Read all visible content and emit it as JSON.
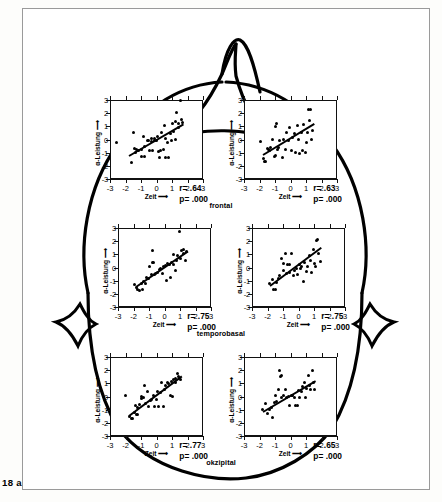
{
  "figure": {
    "caption": "18 a",
    "region_labels": [
      {
        "text": "frontal",
        "x": 221,
        "y": 201
      },
      {
        "text": "temporobasal",
        "x": 221,
        "y": 329
      },
      {
        "text": "okzipital",
        "x": 221,
        "y": 458
      }
    ],
    "head_outline_name": "head-outline-top-view"
  },
  "axes": {
    "xlabel": "Zeit ⟶",
    "ylabel": "α-Leistung ⟶",
    "xticks": [
      "-3",
      "-2",
      "-1",
      "0",
      "1",
      "2",
      "3"
    ],
    "yticks": [
      "3",
      "2",
      "1",
      "0",
      "-1",
      "-2",
      "-3"
    ],
    "xlim": [
      -3,
      3
    ],
    "ylim": [
      -3,
      3
    ]
  },
  "chart_data": [
    {
      "type": "scatter",
      "name": "frontal-left",
      "title": "frontal (left hemisphere)",
      "xlabel": "Zeit ⟶",
      "ylabel": "α-Leistung ⟶",
      "xlim": [
        -3,
        3
      ],
      "ylim": [
        -3,
        3
      ],
      "grid": false,
      "annotations": {
        "r": "r= .64",
        "p": "p= .000"
      },
      "r": 0.64,
      "p": 0.0,
      "fit_line": {
        "x0": -1.75,
        "y0": -1.15,
        "x1": 1.75,
        "y1": 1.25
      },
      "points": [
        [
          -2.55,
          -0.2
        ],
        [
          -1.6,
          -1.75
        ],
        [
          -1.5,
          0.5
        ],
        [
          -1.45,
          -0.7
        ],
        [
          -1.35,
          -0.95
        ],
        [
          -1.3,
          -0.75
        ],
        [
          -1.15,
          -0.8
        ],
        [
          -1.0,
          -1.3
        ],
        [
          -0.95,
          -0.75
        ],
        [
          -0.85,
          0.25
        ],
        [
          -0.8,
          -1.3
        ],
        [
          -0.75,
          -0.5
        ],
        [
          -0.6,
          -0.1
        ],
        [
          -0.5,
          -0.05
        ],
        [
          -0.45,
          -0.85
        ],
        [
          -0.35,
          0.1
        ],
        [
          -0.3,
          -0.15
        ],
        [
          -0.25,
          -0.85
        ],
        [
          -0.15,
          -0.05
        ],
        [
          -0.1,
          0.05
        ],
        [
          0.0,
          -0.1
        ],
        [
          0.05,
          0.2
        ],
        [
          0.1,
          -0.9
        ],
        [
          0.2,
          -1.35
        ],
        [
          0.25,
          -0.8
        ],
        [
          0.35,
          0.55
        ],
        [
          0.45,
          -0.75
        ],
        [
          0.5,
          1.05
        ],
        [
          0.55,
          -1.4
        ],
        [
          0.6,
          0.05
        ],
        [
          0.7,
          -0.25
        ],
        [
          0.8,
          -1.35
        ],
        [
          0.9,
          0.45
        ],
        [
          0.95,
          -0.1
        ],
        [
          1.05,
          1.2
        ],
        [
          1.1,
          0.6
        ],
        [
          1.2,
          1.35
        ],
        [
          1.25,
          0.0
        ],
        [
          1.3,
          2.05
        ],
        [
          1.4,
          0.9
        ],
        [
          1.45,
          1.25
        ],
        [
          1.55,
          2.95
        ],
        [
          1.6,
          1.55
        ],
        [
          1.7,
          1.3
        ]
      ]
    },
    {
      "type": "scatter",
      "name": "frontal-right",
      "title": "frontal (right hemisphere)",
      "xlabel": "Zeit ⟶",
      "ylabel": "α-Leistung ⟶",
      "xlim": [
        -3,
        3
      ],
      "ylim": [
        -3,
        3
      ],
      "grid": false,
      "annotations": {
        "r": "r= .63",
        "p": "p= .000"
      },
      "r": 0.63,
      "p": 0.0,
      "fit_line": {
        "x0": -1.8,
        "y0": -1.1,
        "x1": 1.5,
        "y1": 1.25
      },
      "points": [
        [
          -1.95,
          -0.15
        ],
        [
          -1.75,
          -1.45
        ],
        [
          -1.7,
          -1.7
        ],
        [
          -1.6,
          -1.65
        ],
        [
          -1.5,
          -0.7
        ],
        [
          -1.45,
          -0.75
        ],
        [
          -1.35,
          -0.85
        ],
        [
          -1.3,
          -0.6
        ],
        [
          -1.15,
          0.0
        ],
        [
          -1.05,
          -1.3
        ],
        [
          -1.0,
          -1.25
        ],
        [
          -0.95,
          1.0
        ],
        [
          -0.9,
          1.2
        ],
        [
          -0.85,
          -0.75
        ],
        [
          -0.8,
          -0.6
        ],
        [
          -0.7,
          -0.1
        ],
        [
          -0.5,
          -1.35
        ],
        [
          -0.45,
          0.0
        ],
        [
          -0.35,
          -0.75
        ],
        [
          -0.25,
          0.5
        ],
        [
          -0.15,
          -0.1
        ],
        [
          -0.05,
          0.9
        ],
        [
          0.05,
          -0.85
        ],
        [
          0.15,
          0.15
        ],
        [
          0.25,
          0.45
        ],
        [
          0.35,
          -0.95
        ],
        [
          0.45,
          1.05
        ],
        [
          0.5,
          0.0
        ],
        [
          0.6,
          -1.1
        ],
        [
          0.7,
          0.55
        ],
        [
          0.8,
          -0.8
        ],
        [
          0.85,
          1.15
        ],
        [
          0.95,
          -0.95
        ],
        [
          1.0,
          -0.25
        ],
        [
          1.1,
          0.5
        ],
        [
          1.15,
          2.25
        ],
        [
          1.2,
          1.45
        ],
        [
          1.3,
          2.3
        ],
        [
          1.35,
          0.0
        ],
        [
          1.45,
          0.65
        ]
      ]
    },
    {
      "type": "scatter",
      "name": "temporobasal-left",
      "title": "temporobasal (left hemisphere)",
      "xlabel": "Zeit ⟶",
      "ylabel": "α-Leistung ⟶",
      "xlim": [
        -3,
        3
      ],
      "ylim": [
        -3,
        3
      ],
      "grid": false,
      "annotations": {
        "r": "r= .75",
        "p": "p= .000"
      },
      "r": 0.75,
      "p": 0.0,
      "fit_line": {
        "x0": -1.85,
        "y0": -1.4,
        "x1": 1.5,
        "y1": 1.3
      },
      "points": [
        [
          -1.95,
          -1.3
        ],
        [
          -1.8,
          -1.5
        ],
        [
          -1.75,
          -1.7
        ],
        [
          -1.6,
          -1.75
        ],
        [
          -1.5,
          -1.25
        ],
        [
          -1.45,
          -1.7
        ],
        [
          -1.35,
          -1.1
        ],
        [
          -1.25,
          -1.2
        ],
        [
          -1.15,
          -0.75
        ],
        [
          -1.05,
          -0.8
        ],
        [
          -0.95,
          0.05
        ],
        [
          -0.85,
          -0.55
        ],
        [
          -0.8,
          0.35
        ],
        [
          -0.75,
          1.3
        ],
        [
          -0.7,
          0.35
        ],
        [
          -0.65,
          -0.5
        ],
        [
          -0.55,
          -0.45
        ],
        [
          -0.45,
          -0.35
        ],
        [
          -0.35,
          -0.15
        ],
        [
          -0.25,
          -0.05
        ],
        [
          -0.15,
          -0.45
        ],
        [
          -0.05,
          0.05
        ],
        [
          0.05,
          0.15
        ],
        [
          0.15,
          -0.95
        ],
        [
          0.2,
          0.3
        ],
        [
          0.3,
          0.25
        ],
        [
          0.4,
          -0.75
        ],
        [
          0.45,
          0.4
        ],
        [
          0.55,
          0.2
        ],
        [
          0.6,
          0.95
        ],
        [
          0.7,
          -0.2
        ],
        [
          0.8,
          0.55
        ],
        [
          0.85,
          0.9
        ],
        [
          0.95,
          2.75
        ],
        [
          1.0,
          0.65
        ],
        [
          1.1,
          1.3
        ],
        [
          1.2,
          1.1
        ],
        [
          1.25,
          1.35
        ],
        [
          1.35,
          0.5
        ],
        [
          1.45,
          1.25
        ]
      ]
    },
    {
      "type": "scatter",
      "name": "temporobasal-right",
      "title": "temporobasal (right hemisphere)",
      "xlabel": "Zeit ⟶",
      "ylabel": "α-Leistung ⟶",
      "xlim": [
        -3,
        3
      ],
      "ylim": [
        -3,
        3
      ],
      "grid": false,
      "annotations": {
        "r": "r= .75",
        "p": "p= .000"
      },
      "r": 0.75,
      "p": 0.0,
      "fit_line": {
        "x0": -1.85,
        "y0": -1.35,
        "x1": 1.45,
        "y1": 1.55
      },
      "points": [
        [
          -1.85,
          -1.25
        ],
        [
          -1.7,
          -0.9
        ],
        [
          -1.6,
          -1.7
        ],
        [
          -1.5,
          -1.7
        ],
        [
          -1.4,
          -1.15
        ],
        [
          -1.3,
          -0.85
        ],
        [
          -1.2,
          -0.6
        ],
        [
          -1.1,
          0.65
        ],
        [
          -1.0,
          -0.25
        ],
        [
          -0.95,
          0.3
        ],
        [
          -0.85,
          1.05
        ],
        [
          -0.8,
          -0.45
        ],
        [
          -0.7,
          0.2
        ],
        [
          -0.6,
          0.25
        ],
        [
          -0.55,
          -0.35
        ],
        [
          -0.45,
          1.1
        ],
        [
          -0.35,
          -0.6
        ],
        [
          -0.25,
          -0.25
        ],
        [
          -0.15,
          -0.05
        ],
        [
          -0.05,
          -0.5
        ],
        [
          0.05,
          0.2
        ],
        [
          0.15,
          -0.1
        ],
        [
          0.2,
          0.05
        ],
        [
          0.3,
          -1.05
        ],
        [
          0.4,
          0.35
        ],
        [
          0.5,
          -0.3
        ],
        [
          0.6,
          0.05
        ],
        [
          0.7,
          0.9
        ],
        [
          0.8,
          0.55
        ],
        [
          0.85,
          -0.4
        ],
        [
          0.95,
          1.35
        ],
        [
          1.0,
          0.3
        ],
        [
          1.1,
          0.1
        ],
        [
          1.15,
          2.05
        ],
        [
          1.25,
          2.15
        ],
        [
          1.3,
          1.1
        ],
        [
          1.4,
          0.45
        ]
      ]
    },
    {
      "type": "scatter",
      "name": "okzipital-left",
      "title": "okzipital (left hemisphere)",
      "xlabel": "Zeit ⟶",
      "ylabel": "α-Leistung ⟶",
      "xlim": [
        -3,
        3
      ],
      "ylim": [
        -3,
        3
      ],
      "grid": false,
      "annotations": {
        "r": "r= .77",
        "p": "p= .000"
      },
      "r": 0.77,
      "p": 0.0,
      "fit_line": {
        "x0": -1.8,
        "y0": -1.4,
        "x1": 1.6,
        "y1": 1.6
      },
      "points": [
        [
          -1.75,
          -1.55
        ],
        [
          -1.6,
          -1.7
        ],
        [
          -1.55,
          -1.7
        ],
        [
          -1.45,
          -1.25
        ],
        [
          -1.35,
          -0.7
        ],
        [
          -1.3,
          -1.4
        ],
        [
          -1.25,
          -1.4
        ],
        [
          -1.2,
          -0.85
        ],
        [
          -1.1,
          -0.6
        ],
        [
          -1.0,
          0.0
        ],
        [
          -0.95,
          -0.15
        ],
        [
          -0.85,
          -0.1
        ],
        [
          -0.75,
          0.85
        ],
        [
          -0.7,
          -0.55
        ],
        [
          -0.6,
          0.35
        ],
        [
          -0.5,
          -0.75
        ],
        [
          -0.4,
          -0.3
        ],
        [
          -0.3,
          -0.25
        ],
        [
          -0.2,
          0.05
        ],
        [
          -0.1,
          -0.75
        ],
        [
          0.0,
          -0.2
        ],
        [
          0.05,
          0.35
        ],
        [
          0.15,
          -0.75
        ],
        [
          0.25,
          0.3
        ],
        [
          0.35,
          1.05
        ],
        [
          0.45,
          -0.75
        ],
        [
          0.5,
          0.55
        ],
        [
          0.6,
          0.85
        ],
        [
          0.7,
          1.05
        ],
        [
          0.8,
          0.95
        ],
        [
          0.9,
          0.1
        ],
        [
          0.95,
          1.15
        ],
        [
          1.05,
          0.0
        ],
        [
          1.1,
          1.3
        ],
        [
          1.2,
          1.35
        ],
        [
          1.25,
          1.1
        ],
        [
          1.35,
          1.75
        ],
        [
          1.45,
          1.5
        ],
        [
          1.55,
          1.3
        ],
        [
          -2.0,
          0.05
        ]
      ]
    },
    {
      "type": "scatter",
      "name": "okzipital-right",
      "title": "okzipital (right hemisphere)",
      "xlabel": "Zeit ⟶",
      "ylabel": "α-Leistung ⟶",
      "xlim": [
        -3,
        3
      ],
      "ylim": [
        -3,
        3
      ],
      "grid": false,
      "annotations": {
        "r": "r= .65",
        "p": "p= .000"
      },
      "r": 0.65,
      "p": 0.0,
      "fit_line": {
        "x0": -1.8,
        "y0": -1.1,
        "x1": 1.6,
        "y1": 1.25
      },
      "points": [
        [
          -1.8,
          -0.95
        ],
        [
          -1.6,
          -0.55
        ],
        [
          -1.5,
          -1.3
        ],
        [
          -1.35,
          -1.0
        ],
        [
          -1.25,
          -0.85
        ],
        [
          -1.15,
          -1.6
        ],
        [
          -1.05,
          -0.45
        ],
        [
          -1.0,
          0.05
        ],
        [
          -0.9,
          -0.35
        ],
        [
          -0.8,
          0.5
        ],
        [
          -0.7,
          1.95
        ],
        [
          -0.65,
          1.55
        ],
        [
          -0.6,
          1.6
        ],
        [
          -0.55,
          -0.05
        ],
        [
          -0.45,
          0.1
        ],
        [
          -0.35,
          0.55
        ],
        [
          -0.25,
          -0.1
        ],
        [
          -0.15,
          0.0
        ],
        [
          -0.05,
          -0.65
        ],
        [
          0.05,
          0.1
        ],
        [
          0.15,
          0.05
        ],
        [
          0.25,
          -0.05
        ],
        [
          0.35,
          -0.65
        ],
        [
          0.45,
          -0.7
        ],
        [
          0.5,
          0.45
        ],
        [
          0.6,
          -0.05
        ],
        [
          0.7,
          0.35
        ],
        [
          0.8,
          0.75
        ],
        [
          0.9,
          1.05
        ],
        [
          0.95,
          -0.1
        ],
        [
          1.05,
          0.6
        ],
        [
          1.15,
          1.6
        ],
        [
          1.2,
          0.85
        ],
        [
          1.3,
          0.5
        ],
        [
          1.4,
          1.95
        ],
        [
          1.5,
          1.1
        ],
        [
          1.55,
          0.55
        ]
      ]
    }
  ]
}
